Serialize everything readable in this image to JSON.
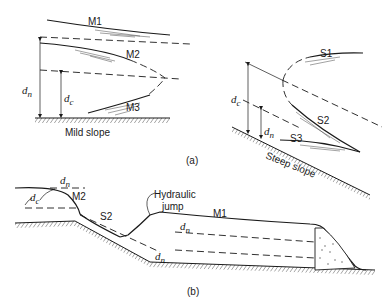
{
  "figure": {
    "panel_a": {
      "caption": "(a)",
      "mild": {
        "slope_label": "Mild slope",
        "curves": [
          "M1",
          "M2",
          "M3"
        ],
        "depth_labels": {
          "normal": "dn",
          "critical": "dc"
        }
      },
      "steep": {
        "slope_label": "Steep slope",
        "curves": [
          "S1",
          "S2",
          "S3"
        ],
        "depth_labels": {
          "normal": "dn",
          "critical": "dc"
        }
      }
    },
    "panel_b": {
      "caption": "(b)",
      "curves": [
        "M2",
        "S2",
        "M1"
      ],
      "annotation": "Hydraulic jump",
      "annotation_line1": "Hydraulic",
      "annotation_line2": "jump",
      "depth_labels": {
        "normal_upstream": "dn",
        "critical": "dc",
        "normal_steep": "dn",
        "normal_downstream": "dn"
      }
    }
  }
}
